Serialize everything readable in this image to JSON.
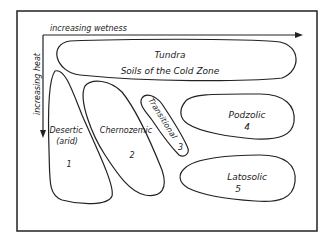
{
  "axes": {
    "x_label": "increasing wetness",
    "y_label": "increasing heat"
  },
  "zones": {
    "tundra": {
      "name": "Tundra",
      "subtitle": "Soils of the Cold Zone"
    },
    "desertic": {
      "name": "Desertic",
      "qualifier": "(arid)",
      "number": "1"
    },
    "chernozemic": {
      "name": "Chernozemic",
      "number": "2"
    },
    "transitional": {
      "name": "Transitional",
      "number": "3"
    },
    "podzolic": {
      "name": "Podzolic",
      "number": "4"
    },
    "latosolic": {
      "name": "Latosolic",
      "number": "5"
    }
  },
  "colors": {
    "ink": "#222222",
    "background": "#ffffff"
  }
}
